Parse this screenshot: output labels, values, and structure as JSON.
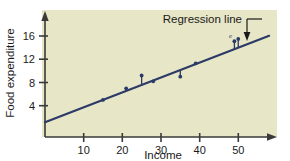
{
  "chart_data": {
    "type": "scatter",
    "title": "",
    "subtitle": "",
    "xlabel": "Income",
    "ylabel": "Food expenditure",
    "xlim": [
      0,
      60
    ],
    "ylim": [
      0,
      19
    ],
    "xticks": [
      10,
      20,
      30,
      40,
      50
    ],
    "yticks": [
      4,
      8,
      12,
      16
    ],
    "grid": false,
    "legend": null,
    "legend_position": "none",
    "background_color": "#e7e6c6",
    "series": [
      {
        "name": "Observations",
        "type": "scatter",
        "color": "#2b3a67",
        "x": [
          15,
          21,
          25,
          28,
          35,
          39,
          49,
          50
        ],
        "y": [
          5.0,
          7.0,
          9.2,
          8.2,
          9.0,
          11.3,
          15.1,
          15.5
        ]
      },
      {
        "name": "Regression line",
        "type": "line",
        "color": "#2b3a67",
        "slope": 0.2567,
        "intercept": 1.15,
        "x": [
          0,
          58
        ],
        "y": [
          1.15,
          16.04
        ]
      }
    ],
    "residual_segments": [
      {
        "x": 15,
        "y_point": 5.0,
        "y_line": 4.99
      },
      {
        "x": 21,
        "y_point": 7.0,
        "y_line": 6.54
      },
      {
        "x": 25,
        "y_point": 9.2,
        "y_line": 7.57
      },
      {
        "x": 28,
        "y_point": 8.2,
        "y_line": 8.34
      },
      {
        "x": 35,
        "y_point": 9.0,
        "y_line": 10.14
      },
      {
        "x": 39,
        "y_point": 11.3,
        "y_line": 11.16
      },
      {
        "x": 49,
        "y_point": 15.1,
        "y_line": 13.73
      },
      {
        "x": 50,
        "y_point": 15.5,
        "y_line": 13.98
      }
    ],
    "annotations": [
      {
        "name": "regression-line-callout",
        "text": "Regression line",
        "text_x": 174,
        "text_y": 22,
        "leader_from": [
          247,
          18
        ],
        "leader_to": [
          247,
          38
        ],
        "arrow": "down"
      },
      {
        "name": "error-term-label",
        "text": "e",
        "x": 227,
        "y": 38
      }
    ]
  },
  "axes": {
    "y_axis_label": "Food expenditure",
    "x_axis_label": "Income",
    "y_tick_labels": [
      "16",
      "12",
      "8",
      "4"
    ],
    "x_tick_labels": [
      "10",
      "20",
      "30",
      "40",
      "50"
    ],
    "axis_color": "#3a3a3a",
    "arrow_heads": [
      "y-top",
      "x-right"
    ]
  },
  "annotations": {
    "regression_label": "Regression line",
    "error_symbol": "e"
  },
  "colors": {
    "plot_background": "#e7e6c6",
    "page_background": "#ffffff",
    "data_color": "#2b3a67",
    "axis_color": "#3a3a3a",
    "text_color": "#1a1a1a"
  }
}
